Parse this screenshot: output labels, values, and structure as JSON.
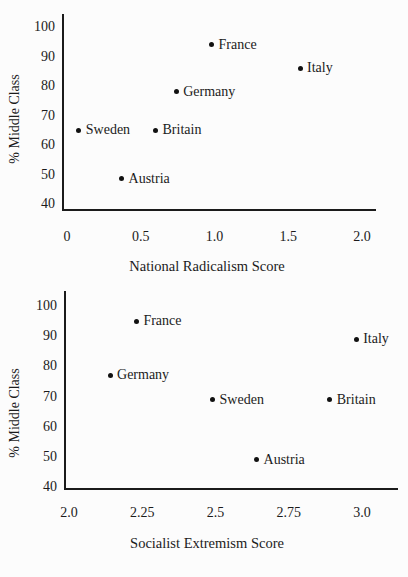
{
  "page": {
    "background": "#fcfcfc",
    "ink_color": "#1b1b1b"
  },
  "chart_data": [
    {
      "type": "scatter",
      "title": "",
      "xlabel": "National Radicalism Score",
      "ylabel": "% Middle Class",
      "xlim": [
        0,
        2.0
      ],
      "ylim": [
        40,
        100
      ],
      "grid": false,
      "legend": "none",
      "x_ticks": [
        "0",
        "0.5",
        "1.0",
        "1.5",
        "2.0"
      ],
      "x_tick_values": [
        0,
        0.5,
        1.0,
        1.5,
        2.0
      ],
      "y_ticks": [
        "100",
        "90",
        "80",
        "70",
        "60",
        "50",
        "40"
      ],
      "y_tick_values": [
        100,
        90,
        80,
        70,
        60,
        50,
        40
      ],
      "points": [
        {
          "label": "France",
          "x": 0.98,
          "y": 94
        },
        {
          "label": "Italy",
          "x": 1.58,
          "y": 86
        },
        {
          "label": "Germany",
          "x": 0.74,
          "y": 78
        },
        {
          "label": "Sweden",
          "x": 0.08,
          "y": 65
        },
        {
          "label": "Britain",
          "x": 0.6,
          "y": 65
        },
        {
          "label": "Austria",
          "x": 0.37,
          "y": 48.5
        }
      ]
    },
    {
      "type": "scatter",
      "title": "",
      "xlabel": "Socialist Extremism Score",
      "ylabel": "% Middle Class",
      "xlim": [
        2.0,
        3.0
      ],
      "ylim": [
        40,
        100
      ],
      "grid": false,
      "legend": "none",
      "x_ticks": [
        "2.0",
        "2.25",
        "2.5",
        "2.75",
        "3.0"
      ],
      "x_tick_values": [
        2.0,
        2.25,
        2.5,
        2.75,
        3.0
      ],
      "y_ticks": [
        "100",
        "90",
        "80",
        "70",
        "60",
        "50",
        "40"
      ],
      "y_tick_values": [
        100,
        90,
        80,
        70,
        60,
        50,
        40
      ],
      "points": [
        {
          "label": "France",
          "x": 2.23,
          "y": 95
        },
        {
          "label": "Italy",
          "x": 2.98,
          "y": 89
        },
        {
          "label": "Germany",
          "x": 2.14,
          "y": 77
        },
        {
          "label": "Sweden",
          "x": 2.49,
          "y": 69
        },
        {
          "label": "Britain",
          "x": 2.89,
          "y": 69
        },
        {
          "label": "Austria",
          "x": 2.64,
          "y": 49
        }
      ]
    }
  ]
}
